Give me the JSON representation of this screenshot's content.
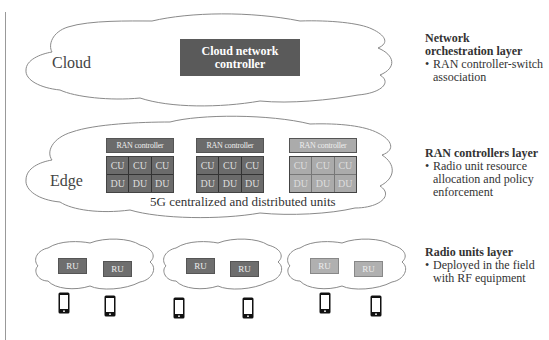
{
  "layers": {
    "cloud": {
      "label": "Cloud",
      "controller_label": "Cloud network controller",
      "controller_color": "#5a5a5a"
    },
    "edge": {
      "label": "Edge",
      "caption": "5G centralized and distributed units",
      "groups": [
        {
          "header": "RAN controller",
          "shade": "dark",
          "color": "#6b6b6b",
          "cu": [
            "CU",
            "CU",
            "CU"
          ],
          "du": [
            "DU",
            "DU",
            "DU"
          ]
        },
        {
          "header": "RAN controller",
          "shade": "dark",
          "color": "#6b6b6b",
          "cu": [
            "CU",
            "CU",
            "CU"
          ],
          "du": [
            "DU",
            "DU",
            "DU"
          ]
        },
        {
          "header": "RAN controller",
          "shade": "light",
          "color": "#ababab",
          "cu": [
            "CU",
            "CU",
            "CU"
          ],
          "du": [
            "DU",
            "DU",
            "DU"
          ]
        }
      ]
    },
    "radio": {
      "clusters": [
        {
          "units": [
            {
              "label": "RU",
              "shade": "dark"
            },
            {
              "label": "RU",
              "shade": "dark"
            }
          ]
        },
        {
          "units": [
            {
              "label": "RU",
              "shade": "dark"
            },
            {
              "label": "RU",
              "shade": "dark"
            }
          ]
        },
        {
          "units": [
            {
              "label": "RU",
              "shade": "light"
            },
            {
              "label": "RU",
              "shade": "light"
            }
          ]
        }
      ],
      "phone_icon": "smartphone-icon",
      "phone_count": 6
    }
  },
  "side_notes": [
    {
      "title": "Network orchestration layer",
      "title_line1": "Network",
      "title_line2": "orchestration layer",
      "bullet": "RAN controller-switch association",
      "bullet_line1": "RAN controller-switch",
      "bullet_line2": "association"
    },
    {
      "title": "RAN controllers layer",
      "bullet": "Radio unit resource allocation and policy enforcement",
      "bullet_line1": "Radio unit resource",
      "bullet_line2": "allocation and policy",
      "bullet_line3": "enforcement"
    },
    {
      "title": "Radio units layer",
      "bullet": "Deployed in the field with RF equipment",
      "bullet_line1": "Deployed in the field",
      "bullet_line2": "with RF equipment"
    }
  ],
  "bullet_glyph": "•"
}
